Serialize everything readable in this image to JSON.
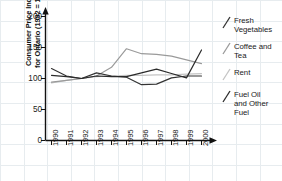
{
  "chart_data": {
    "type": "line",
    "title": "",
    "xlabel": "",
    "ylabel": "Consumer Price Index\nfor Ontario (1992 = 100)",
    "x": [
      1990,
      1991,
      1992,
      1993,
      1994,
      1995,
      1996,
      1997,
      1998,
      1999,
      2000
    ],
    "xtick_labels": [
      "1990",
      "1991",
      "1992",
      "1993",
      "1994",
      "1995",
      "1996",
      "1997",
      "1998",
      "1999",
      "2000"
    ],
    "ytick_labels": [
      "0",
      "50",
      "100",
      "150",
      "200"
    ],
    "yticks": [
      0,
      50,
      100,
      150,
      200
    ],
    "ylim": [
      0,
      200
    ],
    "grid": true,
    "legend_position": "right",
    "series": [
      {
        "name": "Fresh Vegetables",
        "label": "Fresh\nVegetables",
        "color": "#333333",
        "values": [
          116,
          104,
          100,
          109,
          104,
          102,
          90,
          91,
          101,
          104,
          104
        ]
      },
      {
        "name": "Coffee and Tea",
        "label": "Coffee and\nTea",
        "color": "#9a9a9a",
        "values": [
          94,
          97,
          100,
          104,
          118,
          148,
          140,
          139,
          136,
          130,
          124
        ]
      },
      {
        "name": "Rent",
        "label": "Rent",
        "color": "#c4c4c4",
        "values": [
          93,
          97,
          100,
          103,
          104,
          105,
          105,
          106,
          106,
          107,
          108
        ]
      },
      {
        "name": "Fuel Oil and Other Fuel",
        "label": "Fuel Oil\nand Other\nFuel",
        "color": "#2b2b2b",
        "values": [
          105,
          103,
          100,
          104,
          103,
          103,
          109,
          115,
          108,
          101,
          146
        ]
      }
    ]
  },
  "axes": {
    "y_title": "Consumer Price Index\nfor Ontario (1992 = 100)",
    "y_labels": [
      "200",
      "150",
      "100",
      "50",
      "0"
    ],
    "x_labels": [
      "1990",
      "1991",
      "1992",
      "1993",
      "1994",
      "1995",
      "1996",
      "1997",
      "1998",
      "1999",
      "2000"
    ]
  },
  "legend": {
    "items": [
      {
        "label": "Fresh\nVegetables",
        "color": "#333333"
      },
      {
        "label": "Coffee and\nTea",
        "color": "#9a9a9a"
      },
      {
        "label": "Rent",
        "color": "#c4c4c4"
      },
      {
        "label": "Fuel Oil\nand Other\nFuel",
        "color": "#2b2b2b"
      }
    ]
  }
}
